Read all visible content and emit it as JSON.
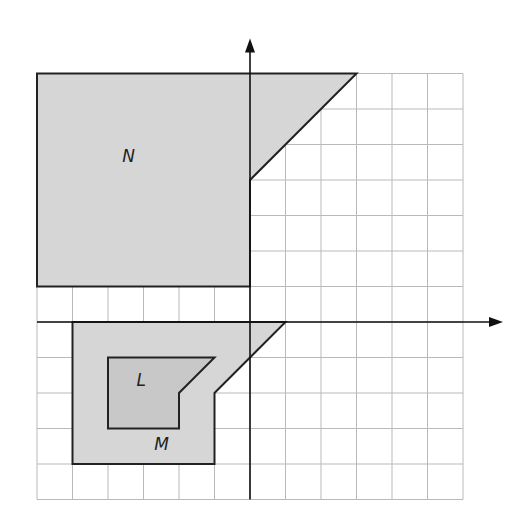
{
  "diagram": {
    "type": "coordinate-plane",
    "x_axis": {
      "label": "x",
      "min": -6,
      "max": 6,
      "ticks": [
        "-6",
        "-5",
        "-4",
        "-3",
        "-2",
        "-1",
        "1",
        "2",
        "3",
        "4",
        "5",
        "6"
      ]
    },
    "y_axis": {
      "label": "y",
      "min": -5,
      "max": 7,
      "ticks": [
        "7",
        "6",
        "5",
        "4",
        "3",
        "2",
        "1",
        "-1",
        "-2",
        "-3",
        "-4",
        "-5"
      ]
    },
    "origin_label": "0",
    "shapes": [
      {
        "name": "N",
        "label": "N",
        "vertices": [
          [
            -6,
            7
          ],
          [
            3,
            7
          ],
          [
            0,
            4
          ],
          [
            0,
            1
          ],
          [
            -6,
            1
          ]
        ],
        "fill": "#d6d6d6"
      },
      {
        "name": "M",
        "label": "M",
        "vertices": [
          [
            -5,
            0
          ],
          [
            1,
            0
          ],
          [
            -1,
            -2
          ],
          [
            -1,
            -4
          ],
          [
            -5,
            -4
          ]
        ],
        "fill": "#d6d6d6"
      },
      {
        "name": "L",
        "label": "L",
        "vertices": [
          [
            -4,
            -1
          ],
          [
            -1,
            -1
          ],
          [
            -2,
            -2
          ],
          [
            -2,
            -3
          ],
          [
            -4,
            -3
          ]
        ],
        "fill": "#c8c8c8"
      }
    ],
    "colors": {
      "fill": "#d6d6d6",
      "inner_fill": "#c8c8c8",
      "grid": "#b9b9b9",
      "outline": "#222222"
    }
  }
}
